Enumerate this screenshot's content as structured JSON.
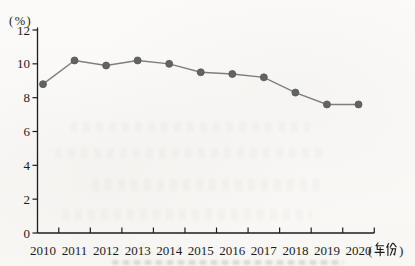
{
  "chart_data": {
    "type": "line",
    "title": "",
    "categories": [
      "2010",
      "2011",
      "2012",
      "2013",
      "2014",
      "2015",
      "2016",
      "2017",
      "2018",
      "2019",
      "2020"
    ],
    "series": [
      {
        "name": "percentage",
        "values": [
          8.8,
          10.2,
          9.9,
          10.2,
          10.0,
          9.5,
          9.4,
          9.2,
          8.3,
          7.6,
          7.6
        ]
      }
    ],
    "ylabel": "(%)",
    "xlabel": "(年份)",
    "ylim": [
      0,
      12
    ],
    "yticks": [
      0,
      2,
      4,
      6,
      8,
      10,
      12
    ],
    "grid": false,
    "legend": "none",
    "colors": {
      "line": "#7e7e7e",
      "marker": "#636363",
      "marker_edge": "#565656",
      "axis": "#1c1c1c",
      "text": "#1c1c1c"
    }
  }
}
